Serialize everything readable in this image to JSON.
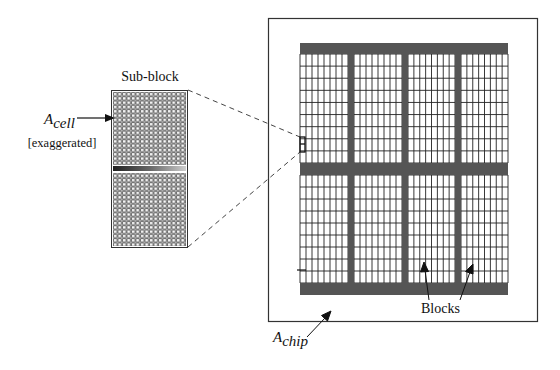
{
  "diagram": {
    "type": "chip-floorplan",
    "labels": {
      "sub_block": "Sub-block",
      "a_cell_main": "A",
      "a_cell_sub": "cell",
      "exaggerated": "[exaggerated]",
      "a_chip_main": "A",
      "a_chip_sub": "chip",
      "blocks": "Blocks"
    },
    "colors": {
      "bus": "#555555",
      "grid_line": "#222222",
      "outline": "#333333",
      "background": "#ffffff"
    },
    "chip": {
      "block_columns": 4,
      "block_rows": 2,
      "cell_columns_per_block": 8,
      "cell_rows_per_block": 9
    },
    "sub_block": {
      "halves": 2,
      "cell_columns": 14,
      "cell_rows_per_half": 17
    }
  }
}
